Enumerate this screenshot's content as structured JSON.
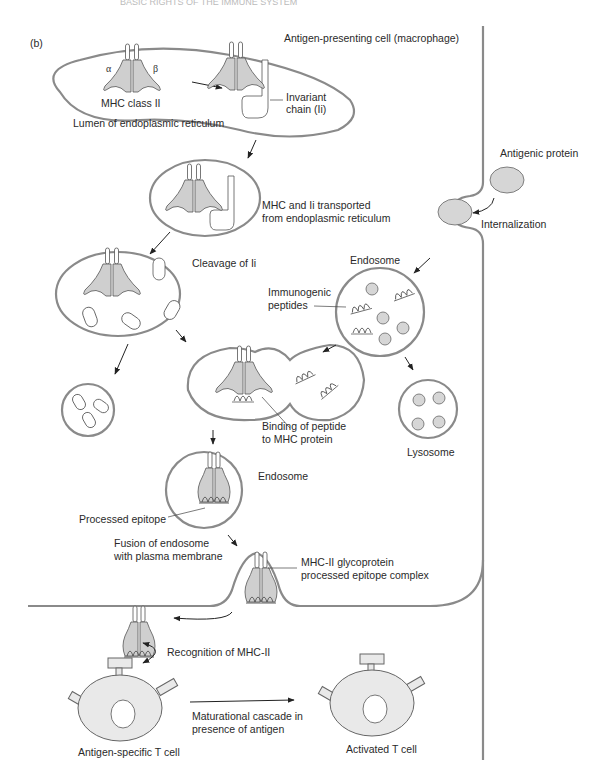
{
  "header": {
    "running_text": "BASIC RIGHTS OF THE IMMUNE SYSTEM"
  },
  "figure": {
    "panel_label": "(b)",
    "cell_title": "Antigen-presenting cell (macrophage)",
    "labels": {
      "alpha": "α",
      "beta": "β",
      "mhc_class_ii": "MHC class II",
      "er_lumen": "Lumen of endoplasmic reticulum",
      "invariant_1": "Invariant",
      "invariant_2": "chain (Ii)",
      "transport_1": "MHC and Ii transported",
      "transport_2": "from endoplasmic reticulum",
      "cleavage": "Cleavage of Ii",
      "antigenic_protein": "Antigenic protein",
      "internalization": "Internalization",
      "endosome_top": "Endosome",
      "immunogenic_1": "Immunogenic",
      "immunogenic_2": "peptides",
      "binding_1": "Binding of peptide",
      "binding_2": "to MHC protein",
      "lysosome": "Lysosome",
      "endosome_mid": "Endosome",
      "processed_epitope": "Processed epitope",
      "fusion_1": "Fusion of endosome",
      "fusion_2": "with plasma membrane",
      "complex_1": "MHC-II glycoprotein",
      "complex_2": "processed epitope complex",
      "recognition": "Recognition of MHC-II",
      "cascade_1": "Maturational cascade in",
      "cascade_2": "presence of antigen",
      "t_cell": "Antigen-specific T cell",
      "activated_t_cell": "Activated T cell"
    },
    "colors": {
      "membrane": "#8a8a8a",
      "protein_fill": "#cfcfcf",
      "tcell_fill": "#e9e9e9",
      "text": "#2a2a2a"
    }
  }
}
